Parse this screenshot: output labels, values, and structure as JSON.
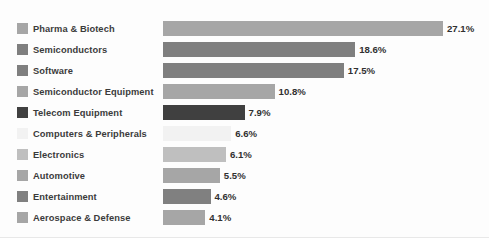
{
  "chart_data": {
    "type": "bar",
    "orientation": "horizontal",
    "title": "",
    "subtitle": "",
    "xlabel": "",
    "ylabel": "",
    "grid": false,
    "legend_position": "left",
    "value_suffix": "%",
    "xlim": [
      0,
      27.1
    ],
    "categories": [
      "Pharma & Biotech",
      "Semiconductors",
      "Software",
      "Semiconductor Equipment",
      "Telecom Equipment",
      "Computers & Peripherals",
      "Electronics",
      "Automotive",
      "Entertainment",
      "Aerospace & Defense"
    ],
    "values": [
      27.1,
      18.6,
      17.5,
      10.8,
      7.9,
      6.6,
      6.1,
      5.5,
      4.6,
      4.1
    ],
    "data_labels": [
      "27.1%",
      "18.6%",
      "17.5%",
      "10.8%",
      "7.9%",
      "6.6%",
      "6.1%",
      "5.5%",
      "4.6%",
      "4.1%"
    ],
    "colors": [
      "#a6a6a6",
      "#7f7f7f",
      "#7f7f7f",
      "#a6a6a6",
      "#404040",
      "#f2f2f2",
      "#bfbfbf",
      "#a6a6a6",
      "#808080",
      "#a6a6a6"
    ],
    "series": [
      {
        "name": "Share",
        "values": [
          27.1,
          18.6,
          17.5,
          10.8,
          7.9,
          6.6,
          6.1,
          5.5,
          4.6,
          4.1
        ]
      }
    ]
  },
  "legend": {
    "items": [
      {
        "label": "Pharma & Biotech",
        "color": "#a6a6a6"
      },
      {
        "label": "Semiconductors",
        "color": "#7f7f7f"
      },
      {
        "label": "Software",
        "color": "#7f7f7f"
      },
      {
        "label": "Semiconductor Equipment",
        "color": "#a6a6a6"
      },
      {
        "label": "Telecom Equipment",
        "color": "#404040"
      },
      {
        "label": "Computers & Peripherals",
        "color": "#f2f2f2"
      },
      {
        "label": "Electronics",
        "color": "#bfbfbf"
      },
      {
        "label": "Automotive",
        "color": "#a6a6a6"
      },
      {
        "label": "Entertainment",
        "color": "#808080"
      },
      {
        "label": "Aerospace & Defense",
        "color": "#a6a6a6"
      }
    ]
  }
}
